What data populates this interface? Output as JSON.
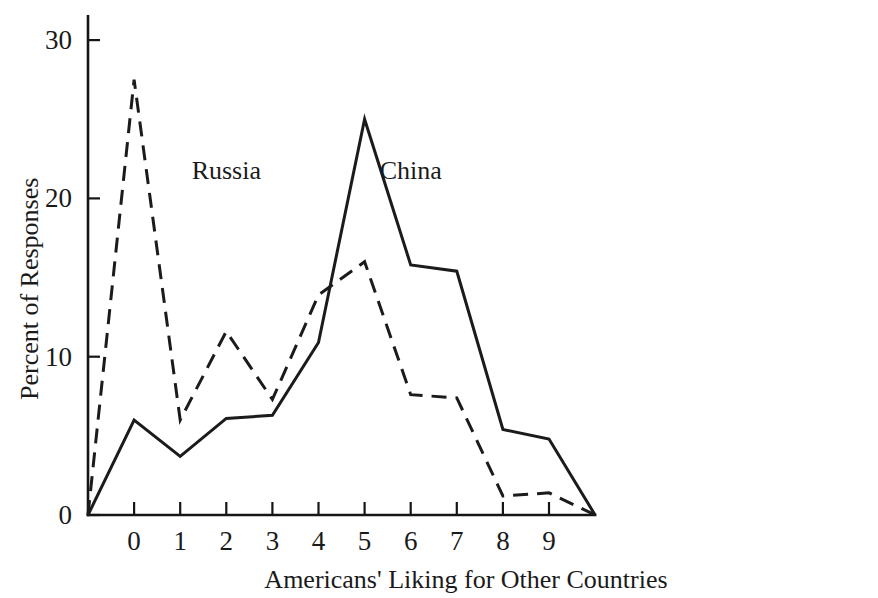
{
  "chart_data": {
    "type": "line",
    "title": "",
    "subtitle": "",
    "xlabel": "Americans' Liking  for Other Countries",
    "ylabel": "Percent of Responses",
    "x": [
      -1,
      0,
      1,
      2,
      3,
      4,
      5,
      6,
      7,
      8,
      9,
      10
    ],
    "xtick_labels": [
      "0",
      "1",
      "2",
      "3",
      "4",
      "5",
      "6",
      "7",
      "8",
      "9"
    ],
    "xtick_values": [
      0,
      1,
      2,
      3,
      4,
      5,
      6,
      7,
      8,
      9
    ],
    "ytick_labels": [
      "0",
      "10",
      "20",
      "30"
    ],
    "ytick_values": [
      0,
      10,
      20,
      30
    ],
    "xlim": [
      -1,
      10
    ],
    "ylim": [
      0,
      31.5
    ],
    "grid": false,
    "legend_position": "inline-annotation",
    "series": [
      {
        "name": "Russia",
        "style": "dashed",
        "label_x": 2,
        "label_y": 21.2,
        "values": [
          0,
          27.5,
          6.0,
          11.6,
          7.3,
          13.9,
          16.0,
          7.6,
          7.4,
          1.2,
          1.4,
          0
        ]
      },
      {
        "name": "China",
        "style": "solid",
        "label_x": 6,
        "label_y": 21.2,
        "values": [
          0,
          6.0,
          3.7,
          6.1,
          6.3,
          10.9,
          25.0,
          15.8,
          15.4,
          5.4,
          4.8,
          0
        ]
      }
    ]
  },
  "colors": {
    "ink": "#1a1a1a",
    "background": "#ffffff"
  }
}
